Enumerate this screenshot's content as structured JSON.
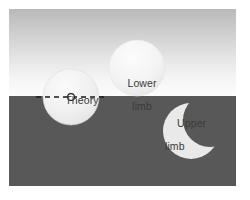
{
  "figure": {
    "background": {
      "sky_color_top": "#b9b9b9",
      "sky_color_bottom": "#fcfcfc",
      "ground_color": "#585858",
      "horizon_y": 87
    },
    "labels": {
      "theory": "Theory",
      "lower_line1": "Lower",
      "lower_line2": "limb",
      "upper_line1": "Upper",
      "upper_line2": "limb"
    },
    "shapes": [
      {
        "name": "theory-disk",
        "type": "circle",
        "cx": 62,
        "cy": 88,
        "r": 28,
        "fill": "#ededed",
        "note": "full solar disk centred on the horizon line"
      },
      {
        "name": "lower-limb-disk",
        "type": "circle",
        "cx": 128,
        "cy": 59,
        "r": 28,
        "fill": "#f0f0f0",
        "note": "solar disk tangent above the horizon"
      },
      {
        "name": "upper-limb-crescent",
        "type": "crescent",
        "cx": 182,
        "cy": 122,
        "r": 28,
        "bite_cx": 201,
        "bite_cy": 111,
        "bite_r": 27,
        "fill": "#e8e8e8",
        "note": "crescent of solar disk below the horizon"
      }
    ],
    "sight_line": {
      "name": "horizon-sight-line",
      "style": "dashed",
      "color": "#1a1a1a",
      "x1": 27,
      "x2": 98,
      "y": 88,
      "dash": "5 4",
      "width": 1.6
    },
    "observer_marker": {
      "name": "disk-centre-marker",
      "type": "circle",
      "cx": 62,
      "cy": 88,
      "r": 3.4,
      "fill": "#ffffff",
      "stroke": "#1a1a1a"
    },
    "colors": {
      "text": "#3a3a3a",
      "line": "#1a1a1a",
      "disk": "#ededed",
      "ground": "#585858"
    }
  }
}
